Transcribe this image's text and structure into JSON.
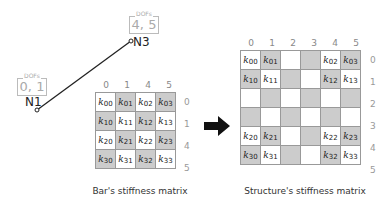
{
  "nodes": {
    "n1": {
      "label": "N1",
      "dofs_title": "DOFs",
      "dofs": "0, 1"
    },
    "n3": {
      "label": "N3",
      "dofs_title": "DOFs",
      "dofs": "4, 5"
    }
  },
  "bar_matrix": {
    "caption": "Bar's stiffness matrix",
    "col_headers": [
      "0",
      "1",
      "4",
      "5"
    ],
    "row_headers": [
      "0",
      "1",
      "4",
      "5"
    ],
    "cells": [
      [
        "k",
        "00"
      ],
      [
        "k",
        "01"
      ],
      [
        "k",
        "02"
      ],
      [
        "k",
        "03"
      ],
      [
        "k",
        "10"
      ],
      [
        "k",
        "11"
      ],
      [
        "k",
        "12"
      ],
      [
        "k",
        "13"
      ],
      [
        "k",
        "20"
      ],
      [
        "k",
        "21"
      ],
      [
        "k",
        "22"
      ],
      [
        "k",
        "23"
      ],
      [
        "k",
        "30"
      ],
      [
        "k",
        "31"
      ],
      [
        "k",
        "32"
      ],
      [
        "k",
        "33"
      ]
    ]
  },
  "structure_matrix": {
    "caption": "Structure's stiffness matrix",
    "col_headers": [
      "0",
      "1",
      "2",
      "3",
      "4",
      "5"
    ],
    "row_headers": [
      "0",
      "1",
      "2",
      "3",
      "4",
      "5"
    ]
  },
  "arrow": "right-arrow"
}
